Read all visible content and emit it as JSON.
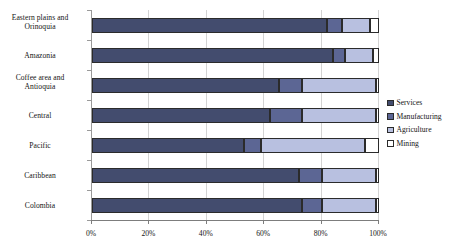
{
  "chart_data": {
    "type": "bar",
    "orientation": "horizontal",
    "stacked": true,
    "stack_mode": "percent",
    "title": "",
    "xlabel": "",
    "ylabel": "",
    "xlim": [
      0,
      100
    ],
    "grid": true,
    "legend_position": "right",
    "xticks": [
      "0%",
      "20%",
      "40%",
      "60%",
      "80%",
      "100%"
    ],
    "xtick_values": [
      0,
      20,
      40,
      60,
      80,
      100
    ],
    "categories": [
      "Eastern plains and Orinoquia",
      "Amazonia",
      "Coffee area and Antioquia",
      "Central",
      "Pacific",
      "Caribbean",
      "Colombia"
    ],
    "series": [
      {
        "name": "Services",
        "color": "#434c6e",
        "values": [
          82,
          84,
          65,
          62,
          53,
          72,
          73
        ]
      },
      {
        "name": "Manufacturing",
        "color": "#5c6694",
        "values": [
          5,
          4,
          8,
          11,
          6,
          8,
          7
        ]
      },
      {
        "name": "Agriculture",
        "color": "#b8c0e0",
        "values": [
          10,
          10,
          26,
          26,
          36,
          19,
          19
        ]
      },
      {
        "name": "Mining",
        "color": "#ffffff",
        "values": [
          3,
          2,
          1,
          1,
          5,
          1,
          1
        ]
      }
    ]
  },
  "legend": {
    "items": [
      {
        "label": "Services"
      },
      {
        "label": "Manufacturing"
      },
      {
        "label": "Agriculture"
      },
      {
        "label": "Mining"
      }
    ]
  }
}
